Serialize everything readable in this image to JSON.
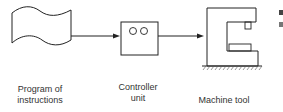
{
  "diagram": {
    "nodes": [
      {
        "id": "program",
        "label_line1": "Program of",
        "label_line2": "instructions",
        "shape": "punched-tape"
      },
      {
        "id": "controller",
        "label_line1": "Controller",
        "label_line2": "unit",
        "shape": "box-with-two-circles"
      },
      {
        "id": "machine",
        "label": "Machine tool",
        "shape": "c-frame-machine"
      }
    ],
    "edges": [
      {
        "from": "program",
        "to": "controller"
      },
      {
        "from": "controller",
        "to": "machine"
      }
    ],
    "colors": {
      "stroke": "#222222",
      "text": "#333333",
      "background": "#ffffff"
    }
  }
}
